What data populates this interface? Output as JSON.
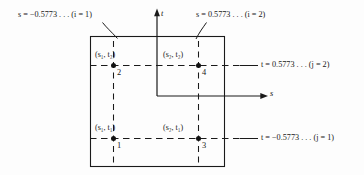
{
  "figure": {
    "background_color": "#fdfdfd",
    "line_color": "#1a1a1a",
    "axes": {
      "vertical_axis_label": "t",
      "horizontal_axis_label": "s"
    },
    "gauss_value": "0.5773",
    "annotations": {
      "s_left": "s = −0.5773 . . . (i = 1)",
      "s_right": "s = 0.5773 . . . (i = 2)",
      "t_top": "t = 0.5773 . . . (j = 2)",
      "t_bottom": "t = −0.5773 . . . (j = 1)"
    },
    "points": [
      {
        "id": "1",
        "label_main": "(s",
        "sub1": "1",
        "mid": ", t",
        "sub2": "1",
        "tail": ")",
        "number": "1"
      },
      {
        "id": "2",
        "label_main": "(s",
        "sub1": "1",
        "mid": ", t",
        "sub2": "2",
        "tail": ")",
        "number": "2"
      },
      {
        "id": "3",
        "label_main": "(s",
        "sub1": "2",
        "mid": ", t",
        "sub2": "1",
        "tail": ")",
        "number": "3"
      },
      {
        "id": "4",
        "label_main": "(s",
        "sub1": "2",
        "mid": ", t",
        "sub2": "2",
        "tail": ")",
        "number": "4"
      }
    ],
    "point_labels": {
      "p1": "(s₁, t₁)",
      "p2": "(s₁, t₂)",
      "p3": "(s₂, t₁)",
      "p4": "(s₂, t₂)"
    },
    "node_numbers": {
      "n1": "1",
      "n2": "2",
      "n3": "3",
      "n4": "4"
    }
  }
}
